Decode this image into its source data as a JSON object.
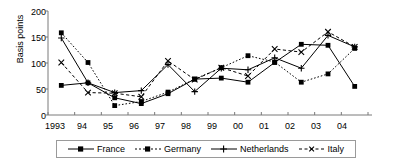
{
  "chart_data": {
    "type": "line",
    "title": "",
    "xlabel": "",
    "ylabel": "Basis points",
    "ylim": [
      0,
      200
    ],
    "yticks": [
      0,
      50,
      100,
      150,
      200
    ],
    "grid": false,
    "legend_position": "bottom",
    "categories": [
      "1993",
      "94",
      "95",
      "96",
      "97",
      "98",
      "99",
      "00",
      "01",
      "02",
      "03",
      "04"
    ],
    "series": [
      {
        "name": "France",
        "marker": "filled-square",
        "line_style": "solid",
        "color": "#000000",
        "values": [
          57,
          62,
          33,
          22,
          41,
          69,
          71,
          63,
          101,
          136,
          134,
          55
        ]
      },
      {
        "name": "Germany",
        "marker": "filled-square",
        "line_style": "dotted",
        "color": "#000000",
        "values": [
          158,
          101,
          18,
          26,
          44,
          69,
          91,
          114,
          102,
          63,
          79,
          128
        ]
      },
      {
        "name": "Netherlands",
        "marker": "plus",
        "line_style": "solid",
        "color": "#000000",
        "values": [
          148,
          62,
          43,
          47,
          97,
          45,
          90,
          87,
          110,
          90,
          153,
          131
        ]
      },
      {
        "name": "Italy",
        "marker": "cross",
        "line_style": "dashed",
        "color": "#000000",
        "values": [
          101,
          43,
          42,
          35,
          104,
          68,
          91,
          75,
          127,
          121,
          160,
          131
        ]
      }
    ]
  },
  "axis": {
    "y_label": "Basis points",
    "y_ticks": [
      "200",
      "150",
      "100",
      "50",
      "0"
    ],
    "x_ticks": [
      "1993",
      "94",
      "95",
      "96",
      "97",
      "98",
      "99",
      "00",
      "01",
      "02",
      "03",
      "04"
    ]
  },
  "legend": {
    "items": [
      {
        "label": "France"
      },
      {
        "label": "Germany"
      },
      {
        "label": "Netherlands"
      },
      {
        "label": "Italy"
      }
    ]
  },
  "colors": {
    "ink": "#000000",
    "axis": "#7a7a7a",
    "legend_border": "#9a9a9a",
    "background": "#ffffff"
  }
}
